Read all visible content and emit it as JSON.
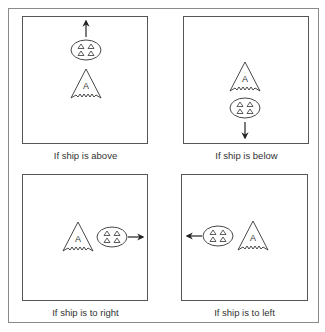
{
  "figure": {
    "border_color": "#8a8a8a",
    "panel_border_color": "#555555",
    "stroke_color": "#333333",
    "panels": [
      {
        "id": "above",
        "caption": "If ship is above",
        "ship_label": "A",
        "formation_label": "enemy formation (4 triangles)",
        "arrow_direction": "up"
      },
      {
        "id": "below",
        "caption": "If ship is below",
        "ship_label": "A",
        "formation_label": "enemy formation (4 triangles)",
        "arrow_direction": "down"
      },
      {
        "id": "right",
        "caption": "If ship is to right",
        "ship_label": "A",
        "formation_label": "enemy formation (4 triangles)",
        "arrow_direction": "right"
      },
      {
        "id": "left",
        "caption": "If ship is to left",
        "ship_label": "A",
        "formation_label": "enemy formation (4 triangles)",
        "arrow_direction": "left"
      }
    ]
  }
}
